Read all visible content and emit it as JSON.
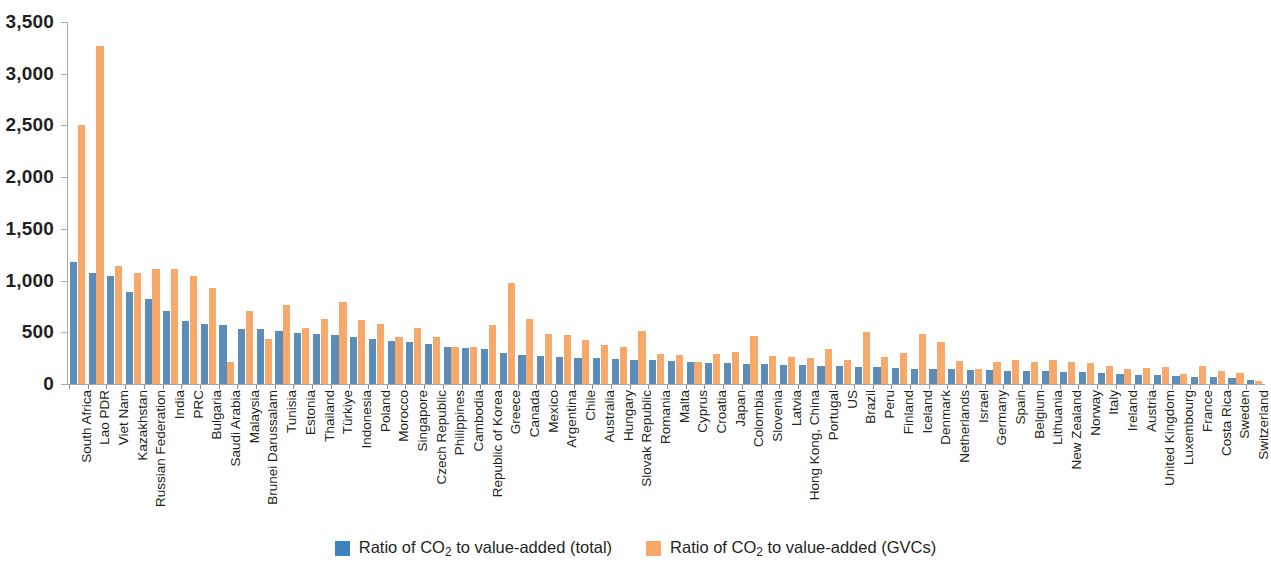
{
  "legend": {
    "items": [
      {
        "key": "total",
        "label_pre": "Ratio of CO",
        "label_sub": "2",
        "label_post": " to value-added (total)",
        "color": "#3c82bd"
      },
      {
        "key": "gvc",
        "label_pre": "Ratio of CO",
        "label_sub": "2",
        "label_post": " to value-added (GVCs)",
        "color": "#f6a96b"
      }
    ]
  },
  "chart_data": {
    "type": "bar",
    "title": "",
    "xlabel": "",
    "ylabel": "",
    "ylim": [
      0,
      3500
    ],
    "yticks": [
      0,
      500,
      1000,
      1500,
      2000,
      2500,
      3000,
      3500
    ],
    "ytick_labels": [
      "0",
      "500",
      "1,000",
      "1,500",
      "2,000",
      "2,500",
      "3,000",
      "3,500"
    ],
    "grid": false,
    "legend_position": "bottom-center",
    "colors": {
      "total": "#5b8db8",
      "gvc": "#f6a96b"
    },
    "categories": [
      "South Africa",
      "Lao PDR",
      "Viet Nam",
      "Kazakhstan",
      "Russian Federation",
      "India",
      "PRC",
      "Bulgaria",
      "Saudi Arabia",
      "Malaysia",
      "Brunei Darussalam",
      "Tunisia",
      "Estonia",
      "Thailand",
      "Türkiye",
      "Indonesia",
      "Poland",
      "Morocco",
      "Singapore",
      "Czech Republic",
      "Philippines",
      "Cambodia",
      "Republic of Korea",
      "Greece",
      "Canada",
      "Mexico",
      "Argentina",
      "Chile",
      "Australia",
      "Hungary",
      "Slovak Republic",
      "Romania",
      "Malta",
      "Cyprus",
      "Croatia",
      "Japan",
      "Colombia",
      "Slovenia",
      "Latvia",
      "Hong Kong, China",
      "Portugal",
      "US",
      "Brazil",
      "Peru",
      "Finland",
      "Iceland",
      "Denmark",
      "Netherlands",
      "Israel",
      "Germany",
      "Spain",
      "Belgium",
      "Lithuania",
      "New Zealand",
      "Norway",
      "Italy",
      "Ireland",
      "Austria",
      "United Kingdom",
      "Luxembourg",
      "France",
      "Costa Rica",
      "Sweden",
      "Switzerland"
    ],
    "series": [
      {
        "name": "Ratio of CO2 to value-added (total)",
        "key": "total",
        "color": "#5b8db8",
        "values": [
          1180,
          1075,
          1040,
          890,
          820,
          710,
          610,
          585,
          570,
          535,
          530,
          510,
          495,
          480,
          470,
          450,
          440,
          420,
          410,
          385,
          360,
          345,
          340,
          300,
          280,
          275,
          265,
          255,
          250,
          240,
          235,
          230,
          225,
          215,
          205,
          200,
          195,
          190,
          185,
          180,
          175,
          170,
          165,
          160,
          155,
          150,
          148,
          145,
          140,
          135,
          130,
          128,
          125,
          120,
          115,
          110,
          95,
          90,
          85,
          75,
          70,
          65,
          55,
          35
        ]
      },
      {
        "name": "Ratio of CO2 to value-added (GVCs)",
        "key": "gvc",
        "color": "#f6a96b",
        "values": [
          2505,
          3265,
          1140,
          1075,
          1110,
          1110,
          1045,
          925,
          215,
          710,
          435,
          760,
          545,
          625,
          790,
          620,
          580,
          455,
          545,
          450,
          360,
          360,
          570,
          975,
          630,
          480,
          475,
          430,
          375,
          355,
          510,
          295,
          280,
          215,
          290,
          305,
          465,
          275,
          265,
          255,
          340,
          235,
          500,
          265,
          300,
          480,
          410,
          225,
          145,
          215,
          235,
          215,
          235,
          210,
          200,
          175,
          150,
          155,
          165,
          95,
          170,
          125,
          105,
          30
        ]
      }
    ]
  }
}
